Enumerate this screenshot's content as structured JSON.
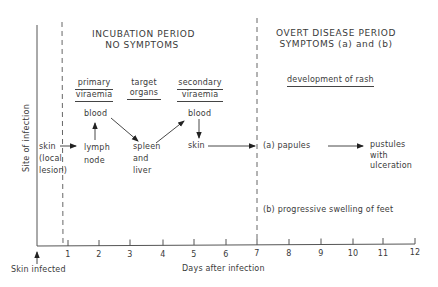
{
  "title_left": {
    "line1": "INCUBATION PERIOD",
    "line2": "NO SYMPTOMS"
  },
  "title_right": {
    "line1": "OVERT DISEASE PERIOD",
    "line2": "SYMPTOMS (a) and (b)"
  },
  "stages": {
    "primary_viraemia": {
      "line1": "primary",
      "line2": "viraemia"
    },
    "target_organs": {
      "line1": "target",
      "line2": "organs"
    },
    "secondary_viraemia": {
      "line1": "secondary",
      "line2": "viraemia"
    },
    "rash": "development of rash"
  },
  "nodes": {
    "skin_local": {
      "line1": "skin",
      "line2": "(local",
      "line3": "lesion)"
    },
    "lymph_node": {
      "line1": "lymph",
      "line2": "node"
    },
    "blood_1": "blood",
    "spleen_liver": {
      "line1": "spleen",
      "line2": "and",
      "line3": "liver"
    },
    "blood_2": "blood",
    "skin_2": "skin",
    "papules": "(a)  papules",
    "pustules": {
      "line1": "pustules",
      "line2": "with",
      "line3": "ulceration"
    },
    "swelling": "(b)  progressive  swelling  of  feet"
  },
  "axes": {
    "ylabel": "Site of infection",
    "xlabel": "Days after infection",
    "origin_label": "Skin infected",
    "ticks": [
      "1",
      "2",
      "3",
      "4",
      "5",
      "6",
      "7",
      "8",
      "9",
      "10",
      "11",
      "12"
    ]
  },
  "colors": {
    "line": "#444444",
    "text": "#3a3a3a"
  }
}
